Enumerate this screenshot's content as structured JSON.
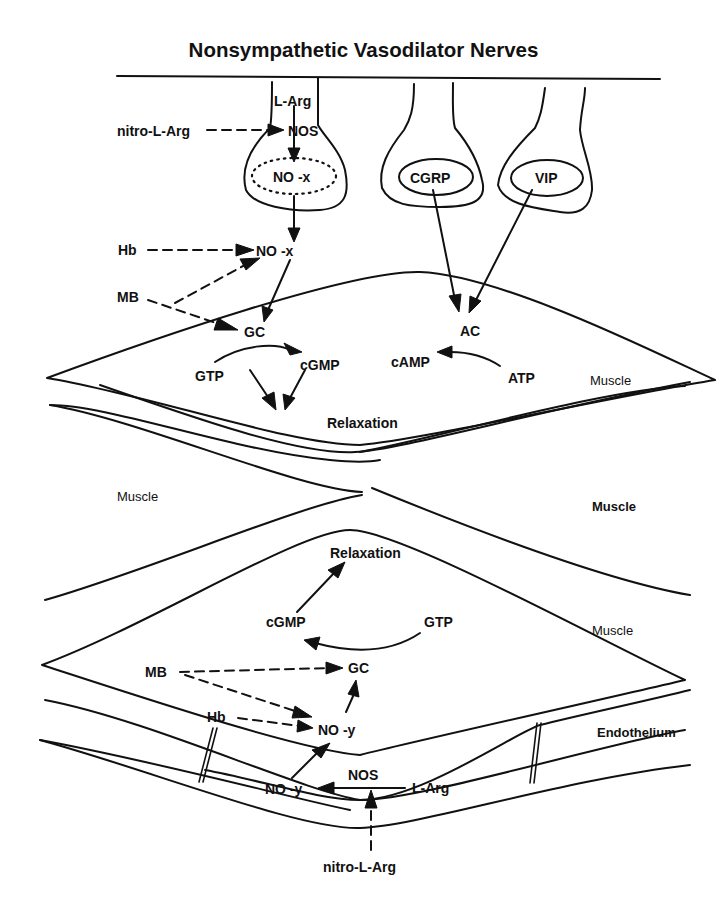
{
  "title": "Nonsympathetic Vasodilator Nerves",
  "colors": {
    "ink": "#111111",
    "background": "#ffffff"
  },
  "nerve_terminals": {
    "nitrergic": {
      "precursor": "L-Arg",
      "enzyme": "NOS",
      "inhibitor": "nitro-L-Arg",
      "vesicle": "NO -x",
      "released": "NO -x",
      "scavenger_hb": "Hb",
      "scavenger_mb": "MB"
    },
    "peptidergic_1": {
      "vesicle": "CGRP"
    },
    "peptidergic_2": {
      "vesicle": "VIP"
    }
  },
  "upper_muscle": {
    "gc": "GC",
    "gtp": "GTP",
    "cgmp": "cGMP",
    "ac": "AC",
    "camp": "cAMP",
    "atp": "ATP",
    "relaxation": "Relaxation",
    "label": "Muscle"
  },
  "middle_muscle": {
    "left_label": "Muscle",
    "right_label": "Muscle"
  },
  "lower_muscle": {
    "relaxation": "Relaxation",
    "cgmp": "cGMP",
    "gtp": "GTP",
    "gc": "GC",
    "label": "Muscle"
  },
  "endothelium": {
    "label": "Endothelium",
    "mb": "MB",
    "hb": "Hb",
    "released": "NO -y",
    "product": "NO -y",
    "enzyme": "NOS",
    "precursor": "L-Arg",
    "inhibitor": "nitro-L-Arg"
  }
}
